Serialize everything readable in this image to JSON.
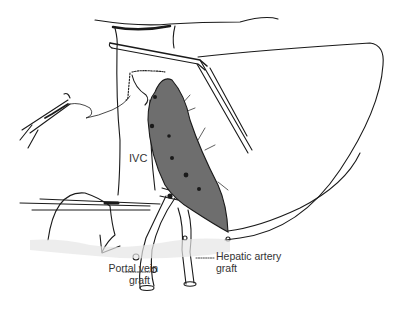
{
  "figure": {
    "labels": {
      "ivc": "IVC",
      "portal_vein_line1": "Portal vein",
      "portal_vein_line2": "graft",
      "hepatic_artery_line1": "Hepatic artery",
      "hepatic_artery_line2": "graft"
    },
    "colors": {
      "line": "#1a1a1a",
      "liver_fill": "#6e6e6e",
      "background": "#ffffff",
      "tissue_stipple": "#cfcfcf"
    }
  }
}
